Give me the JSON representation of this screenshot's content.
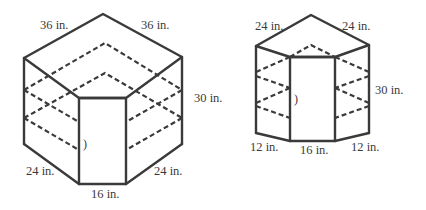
{
  "figures": [
    {
      "id": "large-corner-cabinet",
      "labels": {
        "top_left": "36 in.",
        "top_right": "36 in.",
        "height": "30 in.",
        "bottom_left": "24 in.",
        "bottom_front": "16 in.",
        "bottom_right": "24 in."
      },
      "door_mark": ")"
    },
    {
      "id": "small-corner-cabinet",
      "labels": {
        "top_left": "24 in.",
        "top_right": "24 in.",
        "height": "30 in.",
        "bottom_left": "12 in.",
        "bottom_front": "16 in.",
        "bottom_right": "12 in."
      },
      "door_mark": ")"
    }
  ],
  "colors": {
    "line": "#3a3a3a",
    "background": "#ffffff"
  }
}
